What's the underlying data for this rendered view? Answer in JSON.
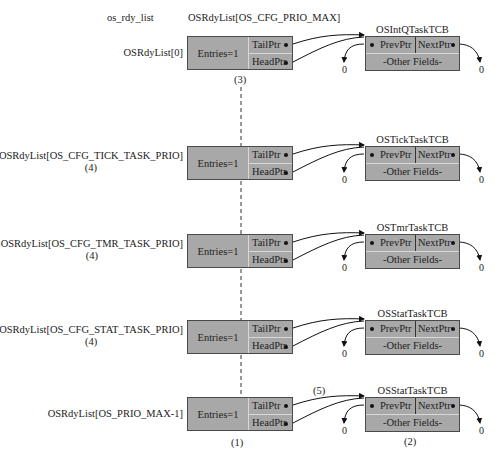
{
  "header": {
    "left_label": "os_rdy_list",
    "center_label": "OSRdyList[OS_CFG_PRIO_MAX]"
  },
  "rows": [
    {
      "label": "OSRdyList[0]",
      "sublabel": "",
      "entries": "Entries=1",
      "tail": "TailPtr",
      "head": "HeadPtr",
      "tcb_name": "OSIntQTaskTCB",
      "prev": "PrevPtr",
      "next": "NextPtr",
      "other": "-Other Fields-",
      "null_left": "0",
      "null_right": "0"
    },
    {
      "label": "OSRdyList[OS_CFG_TICK_TASK_PRIO]",
      "sublabel": "(4)",
      "entries": "Entries=1",
      "tail": "TailPtr",
      "head": "HeadPtr",
      "tcb_name": "OSTickTaskTCB",
      "prev": "PrevPtr",
      "next": "NextPtr",
      "other": "-Other Fields-",
      "null_left": "0",
      "null_right": "0"
    },
    {
      "label": "OSRdyList[OS_CFG_TMR_TASK_PRIO]",
      "sublabel": "(4)",
      "entries": "Entries=1",
      "tail": "TailPtr",
      "head": "HeadPtr",
      "tcb_name": "OSTmrTaskTCB",
      "prev": "PrevPtr",
      "next": "NextPtr",
      "other": "-Other Fields-",
      "null_left": "0",
      "null_right": "0"
    },
    {
      "label": "OSRdyList[OS_CFG_STAT_TASK_PRIO]",
      "sublabel": "(4)",
      "entries": "Entries=1",
      "tail": "TailPtr",
      "head": "HeadPtr",
      "tcb_name": "OSStatTaskTCB",
      "prev": "PrevPtr",
      "next": "NextPtr",
      "other": "-Other Fields-",
      "null_left": "0",
      "null_right": "0"
    },
    {
      "label": "OSRdyList[OS_PRIO_MAX-1]",
      "sublabel": "",
      "entries": "Entries=1",
      "tail": "TailPtr",
      "head": "HeadPtr",
      "tcb_name": "OSStatTaskTCB",
      "prev": "PrevPtr",
      "next": "NextPtr",
      "other": "-Other Fields-",
      "null_left": "0",
      "null_right": "0"
    }
  ],
  "annotations": {
    "a1": "(1)",
    "a2": "(2)",
    "a3": "(3)",
    "a5": "(5)"
  },
  "colors": {
    "box_fill": "#a8a8a8",
    "box_border": "#4a4a4a",
    "separator": "#d8d8d8"
  }
}
